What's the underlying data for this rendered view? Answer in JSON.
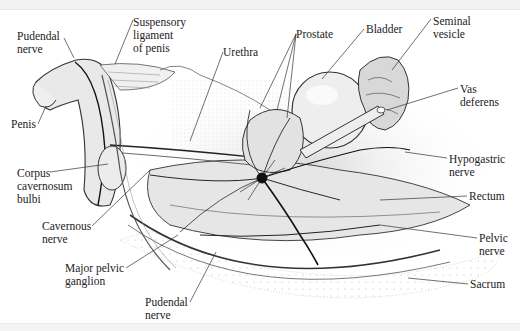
{
  "figure": {
    "type": "anatomical illustration",
    "labels": [
      {
        "id": "pudendal-nerve-top",
        "text": "Pudendal\nnerve",
        "x": 17,
        "y": 30,
        "anchor": [
          74,
          58
        ]
      },
      {
        "id": "suspensory-ligament",
        "text": "Suspensory\nligament\nof penis",
        "x": 133,
        "y": 16,
        "anchor": [
          115,
          64
        ]
      },
      {
        "id": "urethra",
        "text": "Urethra",
        "x": 223,
        "y": 46,
        "anchor": [
          190,
          141
        ]
      },
      {
        "id": "prostate",
        "text": "Prostate",
        "x": 296,
        "y": 28,
        "anchors": [
          [
            260,
            108
          ],
          [
            277,
            110
          ]
        ]
      },
      {
        "id": "bladder",
        "text": "Bladder",
        "x": 366,
        "y": 23,
        "anchor": [
          322,
          79
        ]
      },
      {
        "id": "seminal-vesicle",
        "text": "Seminal\nvesicle",
        "x": 433,
        "y": 15,
        "anchor": [
          392,
          70
        ]
      },
      {
        "id": "penis",
        "text": "Penis",
        "x": 11,
        "y": 118,
        "anchor": [
          46,
          106
        ]
      },
      {
        "id": "vas-deferens",
        "text": "Vas\ndeferens",
        "x": 460,
        "y": 83,
        "anchor": [
          387,
          110
        ]
      },
      {
        "id": "corpus-cavernosum-bulbi",
        "text": "Corpus\ncavernosum\nbulbi",
        "x": 17,
        "y": 167,
        "anchor": [
          108,
          164
        ]
      },
      {
        "id": "hypogastric-nerve",
        "text": "Hypogastric\nnerve",
        "x": 449,
        "y": 153,
        "anchor": [
          405,
          152
        ]
      },
      {
        "id": "rectum",
        "text": "Rectum",
        "x": 469,
        "y": 190,
        "anchor": [
          380,
          200
        ]
      },
      {
        "id": "cavernous-nerve",
        "text": "Cavernous\nnerve",
        "x": 42,
        "y": 220,
        "anchor": [
          150,
          170
        ]
      },
      {
        "id": "major-pelvic-ganglion",
        "text": "Major pelvic\nganglion",
        "x": 65,
        "y": 262,
        "anchor": [
          178,
          235
        ]
      },
      {
        "id": "pelvic-nerve",
        "text": "Pelvic\nnerve",
        "x": 479,
        "y": 232,
        "anchor": [
          380,
          225
        ]
      },
      {
        "id": "sacrum",
        "text": "Sacrum",
        "x": 470,
        "y": 278,
        "anchor": [
          408,
          278
        ]
      },
      {
        "id": "pudendal-nerve-bottom",
        "text": "Pudendal\nnerve",
        "x": 145,
        "y": 296,
        "anchor": [
          216,
          252
        ]
      }
    ]
  }
}
